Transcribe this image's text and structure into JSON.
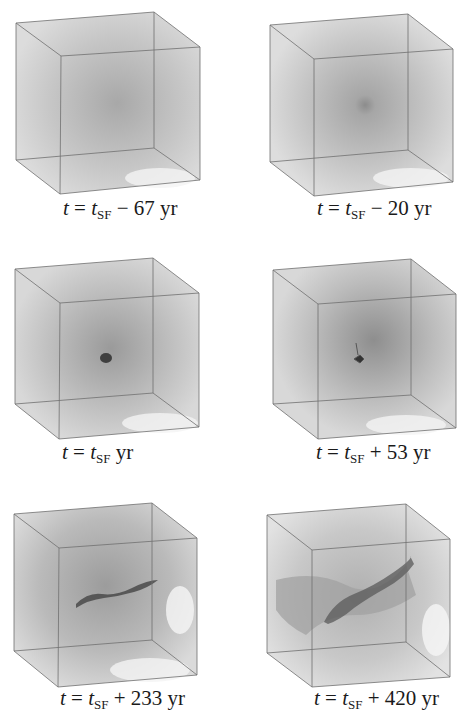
{
  "figure": {
    "panels": [
      {
        "id": "p1",
        "t_var": "t",
        "t_sf": "t",
        "sub": "SF",
        "op": "−",
        "value": "67",
        "unit": "yr",
        "stage": "diffuse",
        "core": 0.0,
        "filament": 0.0
      },
      {
        "id": "p2",
        "t_var": "t",
        "t_sf": "t",
        "sub": "SF",
        "op": "−",
        "value": "20",
        "unit": "yr",
        "stage": "diffuse",
        "core": 0.15,
        "filament": 0.0
      },
      {
        "id": "p3",
        "t_var": "t",
        "t_sf": "t",
        "sub": "SF",
        "op": "",
        "value": "",
        "unit": "yr",
        "stage": "collapse",
        "core": 0.6,
        "filament": 0.0
      },
      {
        "id": "p4",
        "t_var": "t",
        "t_sf": "t",
        "sub": "SF",
        "op": "+",
        "value": "53",
        "unit": "yr",
        "stage": "collapse",
        "core": 0.8,
        "filament": 0.2
      },
      {
        "id": "p5",
        "t_var": "t",
        "t_sf": "t",
        "sub": "SF",
        "op": "+",
        "value": "233",
        "unit": "yr",
        "stage": "filament",
        "core": 0.6,
        "filament": 0.7
      },
      {
        "id": "p6",
        "t_var": "t",
        "t_sf": "t",
        "sub": "SF",
        "op": "+",
        "value": "420",
        "unit": "yr",
        "stage": "filament",
        "core": 0.4,
        "filament": 1.0
      }
    ],
    "captions": [
      "t = tSF − 67 yr",
      "t = tSF − 20 yr",
      "t = tSF yr",
      "t = tSF + 53 yr",
      "t = tSF + 233 yr",
      "t = tSF + 420 yr"
    ],
    "colors": {
      "background": "#ffffff",
      "gas": "#9a9a9a",
      "edge": "#6f6f6f",
      "core": "#3a3a3a"
    }
  }
}
